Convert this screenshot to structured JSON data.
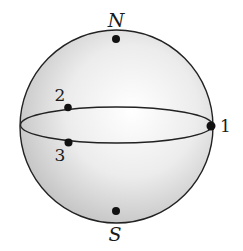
{
  "diagram": {
    "type": "sphere-with-points",
    "colors": {
      "sphere_fill_light": "#ffffff",
      "sphere_fill_dark": "#c9c9c9",
      "outline": "#222222",
      "point": "#111111"
    },
    "poles": {
      "north": {
        "label": "N"
      },
      "south": {
        "label": "S"
      }
    },
    "equator_points": [
      {
        "id": "1",
        "label": "1"
      },
      {
        "id": "2",
        "label": "2"
      },
      {
        "id": "3",
        "label": "3"
      }
    ]
  }
}
